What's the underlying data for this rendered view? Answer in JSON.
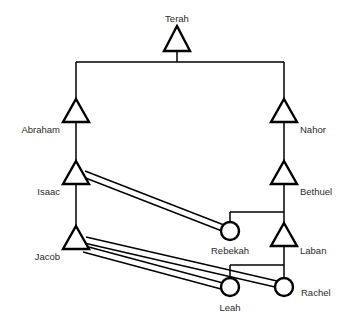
{
  "diagram": {
    "type": "kinship-chart",
    "title": "",
    "colors": {
      "background": "#ffffff",
      "stroke": "#000000",
      "label": "#2b2b2b"
    },
    "symbols": {
      "male": "triangle",
      "female": "circle"
    },
    "nodes": [
      {
        "id": "terah",
        "label": "Terah",
        "sex": "male",
        "shape": "triangle",
        "x": 177,
        "y": 41,
        "label_x": 177,
        "label_y": 22,
        "label_anchor": "middle"
      },
      {
        "id": "abraham",
        "label": "Abraham",
        "sex": "male",
        "shape": "triangle",
        "x": 76,
        "y": 114,
        "label_x": 60,
        "label_y": 133,
        "label_anchor": "end"
      },
      {
        "id": "nahor",
        "label": "Nahor",
        "sex": "male",
        "shape": "triangle",
        "x": 284,
        "y": 114,
        "label_x": 300,
        "label_y": 133,
        "label_anchor": "start"
      },
      {
        "id": "isaac",
        "label": "Isaac",
        "sex": "male",
        "shape": "triangle",
        "x": 76,
        "y": 176,
        "label_x": 60,
        "label_y": 195,
        "label_anchor": "end"
      },
      {
        "id": "bethuel",
        "label": "Bethuel",
        "sex": "male",
        "shape": "triangle",
        "x": 284,
        "y": 176,
        "label_x": 300,
        "label_y": 195,
        "label_anchor": "start"
      },
      {
        "id": "jacob",
        "label": "Jacob",
        "sex": "male",
        "shape": "triangle",
        "x": 76,
        "y": 241,
        "label_x": 60,
        "label_y": 260,
        "label_anchor": "end"
      },
      {
        "id": "rebekah",
        "label": "Rebekah",
        "sex": "female",
        "shape": "circle",
        "x": 230,
        "y": 231,
        "label_x": 230,
        "label_y": 254,
        "label_anchor": "middle"
      },
      {
        "id": "laban",
        "label": "Laban",
        "sex": "male",
        "shape": "triangle",
        "x": 284,
        "y": 238,
        "label_x": 300,
        "label_y": 254,
        "label_anchor": "start"
      },
      {
        "id": "leah",
        "label": "Leah",
        "sex": "female",
        "shape": "circle",
        "x": 230,
        "y": 287,
        "label_x": 230,
        "label_y": 311,
        "label_anchor": "middle"
      },
      {
        "id": "rachel",
        "label": "Rachel",
        "sex": "female",
        "shape": "circle",
        "x": 284,
        "y": 287,
        "label_x": 301,
        "label_y": 296,
        "label_anchor": "start"
      }
    ],
    "descent_links": [
      {
        "id": "terah-stem",
        "from": "terah",
        "to": "sibling-bar-1",
        "kind": "vertical"
      },
      {
        "id": "sibling-bar-1",
        "from": "abraham",
        "to": "nahor",
        "kind": "horizontal"
      },
      {
        "id": "abraham-isaac",
        "from": "abraham",
        "to": "isaac",
        "kind": "vertical"
      },
      {
        "id": "nahor-bethuel",
        "from": "nahor",
        "to": "bethuel",
        "kind": "vertical"
      },
      {
        "id": "isaac-jacob",
        "from": "isaac",
        "to": "jacob",
        "kind": "vertical"
      },
      {
        "id": "bethuel-stem",
        "from": "bethuel",
        "to": "sibling-bar-2",
        "kind": "vertical"
      },
      {
        "id": "sibling-bar-2",
        "from": "rebekah",
        "to": "laban",
        "kind": "horizontal"
      },
      {
        "id": "laban-stem",
        "from": "laban",
        "to": "sibling-bar-3",
        "kind": "vertical"
      },
      {
        "id": "sibling-bar-3",
        "from": "leah",
        "to": "rachel",
        "kind": "horizontal"
      }
    ],
    "marriage_links": [
      {
        "id": "isaac-rebekah",
        "husband": "isaac",
        "wife": "rebekah",
        "style": "double-line"
      },
      {
        "id": "jacob-leah",
        "husband": "jacob",
        "wife": "leah",
        "style": "double-line"
      },
      {
        "id": "jacob-rachel",
        "husband": "jacob",
        "wife": "rachel",
        "style": "double-line"
      }
    ]
  }
}
